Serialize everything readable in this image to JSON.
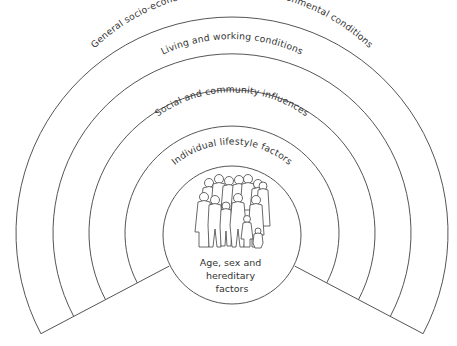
{
  "diagram": {
    "type": "concentric layers of influence on health",
    "layers": [
      {
        "id": "outer",
        "label": "General socio-economic, cultural and environmental conditions"
      },
      {
        "id": "living",
        "label": "Living and working conditions"
      },
      {
        "id": "social",
        "label": "Social and community influences"
      },
      {
        "id": "individual",
        "label": "Individual lifestyle factors"
      }
    ],
    "core": {
      "icon": "people-group-icon",
      "lines": [
        "Age, sex and",
        "hereditary",
        "factors"
      ]
    },
    "colors": {
      "stroke": "#555555",
      "text": "#333333",
      "background": "#ffffff"
    }
  }
}
